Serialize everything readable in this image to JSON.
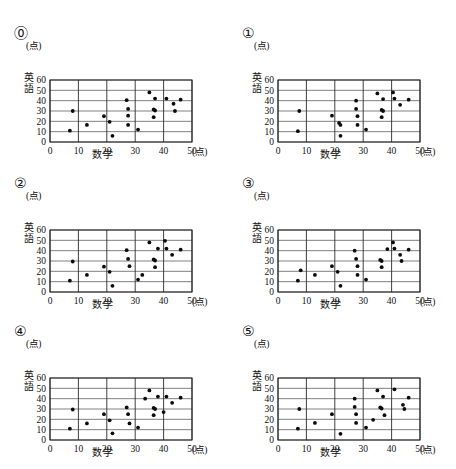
{
  "page": {
    "background_color": "#ffffff",
    "dot_color": "#0b0b0b",
    "grid_color": "#4a4a4a"
  },
  "labels": {
    "unit": "(点)",
    "x_axis": "数学",
    "y_axis_char_1": "英",
    "y_axis_char_2": "語",
    "x_ticks": [
      "0",
      "10",
      "20",
      "30",
      "40",
      "50"
    ],
    "y_ticks": [
      "0",
      "10",
      "20",
      "30",
      "40",
      "50",
      "60"
    ]
  },
  "chart_data": [
    {
      "id": "panel-0",
      "type": "scatter",
      "title": "⓪",
      "xlabel": "数学",
      "ylabel": "英語",
      "xunit": "(点)",
      "yunit": "(点)",
      "xlim": [
        0,
        50
      ],
      "ylim": [
        0,
        60
      ],
      "xticks": [
        0,
        10,
        20,
        30,
        40,
        50
      ],
      "yticks": [
        0,
        10,
        20,
        30,
        40,
        50,
        60
      ],
      "grid": true,
      "points": [
        [
          7,
          11
        ],
        [
          8,
          30
        ],
        [
          13,
          16.5
        ],
        [
          19,
          25
        ],
        [
          21,
          19.5
        ],
        [
          22,
          6
        ],
        [
          27,
          40.5
        ],
        [
          27.5,
          32
        ],
        [
          27.5,
          25.5
        ],
        [
          27.5,
          16.5
        ],
        [
          31,
          12
        ],
        [
          35,
          48
        ],
        [
          36.5,
          31.5
        ],
        [
          37,
          30.5
        ],
        [
          37,
          42
        ],
        [
          36.5,
          24
        ],
        [
          41,
          42
        ],
        [
          43.5,
          37
        ],
        [
          44,
          30
        ],
        [
          46,
          41
        ]
      ]
    },
    {
      "id": "panel-1",
      "type": "scatter",
      "title": "①",
      "xlabel": "数学",
      "ylabel": "英語",
      "xunit": "(点)",
      "yunit": "(点)",
      "xlim": [
        0,
        50
      ],
      "ylim": [
        0,
        60
      ],
      "xticks": [
        0,
        10,
        20,
        30,
        40,
        50
      ],
      "yticks": [
        0,
        10,
        20,
        30,
        40,
        50,
        60
      ],
      "grid": true,
      "points": [
        [
          7,
          10.5
        ],
        [
          7.5,
          30
        ],
        [
          19,
          25.5
        ],
        [
          21.5,
          18.5
        ],
        [
          22,
          16.5
        ],
        [
          22,
          6
        ],
        [
          27.5,
          40
        ],
        [
          27.5,
          32
        ],
        [
          28,
          25
        ],
        [
          28,
          16.5
        ],
        [
          31,
          12
        ],
        [
          35,
          47
        ],
        [
          36.5,
          31
        ],
        [
          37,
          30
        ],
        [
          37,
          41.5
        ],
        [
          36.5,
          24
        ],
        [
          40.5,
          48
        ],
        [
          41,
          42
        ],
        [
          43,
          36
        ],
        [
          46,
          41
        ]
      ]
    },
    {
      "id": "panel-2",
      "type": "scatter",
      "title": "②",
      "xlabel": "数学",
      "ylabel": "英語",
      "xunit": "(点)",
      "yunit": "(点)",
      "xlim": [
        0,
        50
      ],
      "ylim": [
        0,
        60
      ],
      "xticks": [
        0,
        10,
        20,
        30,
        40,
        50
      ],
      "yticks": [
        0,
        10,
        20,
        30,
        40,
        50,
        60
      ],
      "grid": true,
      "points": [
        [
          7,
          11
        ],
        [
          8,
          29.5
        ],
        [
          13,
          16.5
        ],
        [
          19,
          24.5
        ],
        [
          21,
          19.5
        ],
        [
          22,
          6
        ],
        [
          27,
          40.5
        ],
        [
          27.5,
          32
        ],
        [
          28,
          25
        ],
        [
          31,
          12
        ],
        [
          32.5,
          16.5
        ],
        [
          35,
          48
        ],
        [
          36.5,
          31.5
        ],
        [
          37,
          30.5
        ],
        [
          37,
          24
        ],
        [
          38,
          42
        ],
        [
          40.5,
          49.5
        ],
        [
          41,
          42
        ],
        [
          43,
          36
        ],
        [
          46,
          41
        ]
      ]
    },
    {
      "id": "panel-3",
      "type": "scatter",
      "title": "③",
      "xlabel": "数学",
      "ylabel": "英語",
      "xunit": "(点)",
      "yunit": "(点)",
      "xlim": [
        0,
        50
      ],
      "ylim": [
        0,
        60
      ],
      "xticks": [
        0,
        10,
        20,
        30,
        40,
        50
      ],
      "yticks": [
        0,
        10,
        20,
        30,
        40,
        50,
        60
      ],
      "grid": true,
      "points": [
        [
          7,
          11
        ],
        [
          8,
          21
        ],
        [
          13,
          16.5
        ],
        [
          19,
          25
        ],
        [
          21,
          19.5
        ],
        [
          22,
          6
        ],
        [
          27,
          40
        ],
        [
          27.5,
          32
        ],
        [
          28,
          25
        ],
        [
          28,
          16.5
        ],
        [
          31,
          12
        ],
        [
          36,
          31
        ],
        [
          36.5,
          30
        ],
        [
          36.5,
          24
        ],
        [
          38.5,
          41.5
        ],
        [
          40.5,
          48
        ],
        [
          41,
          42
        ],
        [
          43,
          36
        ],
        [
          43.5,
          30
        ],
        [
          46,
          41
        ]
      ]
    },
    {
      "id": "panel-4",
      "type": "scatter",
      "title": "④",
      "xlabel": "数学",
      "ylabel": "英語",
      "xunit": "(点)",
      "yunit": "(点)",
      "xlim": [
        0,
        50
      ],
      "ylim": [
        0,
        60
      ],
      "xticks": [
        0,
        10,
        20,
        30,
        40,
        50
      ],
      "yticks": [
        0,
        10,
        20,
        30,
        40,
        50,
        60
      ],
      "grid": true,
      "points": [
        [
          7,
          11
        ],
        [
          8,
          29.5
        ],
        [
          13,
          16
        ],
        [
          19,
          25
        ],
        [
          21,
          19
        ],
        [
          22,
          6.5
        ],
        [
          27,
          31.5
        ],
        [
          27.5,
          25
        ],
        [
          28,
          16
        ],
        [
          31,
          12
        ],
        [
          33.5,
          40
        ],
        [
          35,
          48
        ],
        [
          36.5,
          31
        ],
        [
          37,
          30
        ],
        [
          36.5,
          24
        ],
        [
          38,
          42
        ],
        [
          40,
          27
        ],
        [
          41,
          42
        ],
        [
          43,
          36
        ],
        [
          46,
          41
        ]
      ]
    },
    {
      "id": "panel-5",
      "type": "scatter",
      "title": "⑤",
      "xlabel": "数学",
      "ylabel": "英語",
      "xunit": "(点)",
      "yunit": "(点)",
      "xlim": [
        0,
        50
      ],
      "ylim": [
        0,
        60
      ],
      "xticks": [
        0,
        10,
        20,
        30,
        40,
        50
      ],
      "yticks": [
        0,
        10,
        20,
        30,
        40,
        50,
        60
      ],
      "grid": true,
      "points": [
        [
          7,
          11
        ],
        [
          7.5,
          30
        ],
        [
          13,
          16.5
        ],
        [
          19,
          25
        ],
        [
          22,
          6
        ],
        [
          27,
          40
        ],
        [
          27,
          32
        ],
        [
          27.5,
          25
        ],
        [
          27.5,
          16.5
        ],
        [
          31,
          12
        ],
        [
          33.5,
          19.5
        ],
        [
          35,
          48
        ],
        [
          36,
          31.5
        ],
        [
          36.5,
          30.5
        ],
        [
          37,
          42
        ],
        [
          37.5,
          24
        ],
        [
          41,
          49
        ],
        [
          44,
          34
        ],
        [
          44.5,
          30
        ],
        [
          46,
          41
        ]
      ]
    }
  ]
}
